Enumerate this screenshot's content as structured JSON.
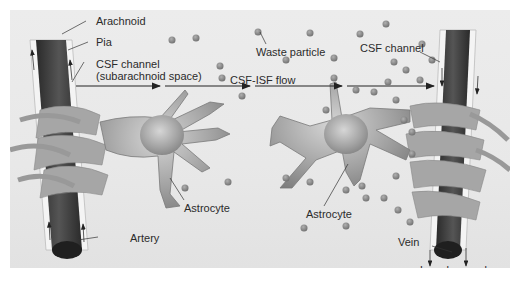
{
  "figure": {
    "labels": {
      "arachnoid": "Arachnoid",
      "pia": "Pia",
      "csf_channel_left_line1": "CSF channel",
      "csf_channel_left_line2": "(subarachnoid space)",
      "waste_particle": "Waste particle",
      "csf_isf_flow": "CSF-ISF flow",
      "csf_channel_right": "CSF channel",
      "astrocyte_left": "Astrocyte",
      "astrocyte_right": "Astrocyte",
      "artery": "Artery",
      "vein": "Vein",
      "lymph_vessels": "Lymph vessels"
    },
    "colors": {
      "background": "#e9e9e9",
      "vessel_dark": "#3a3a3a",
      "astrocyte": "#9a9a9a",
      "particle": "#8c8c8c",
      "arrow": "#222222"
    }
  }
}
